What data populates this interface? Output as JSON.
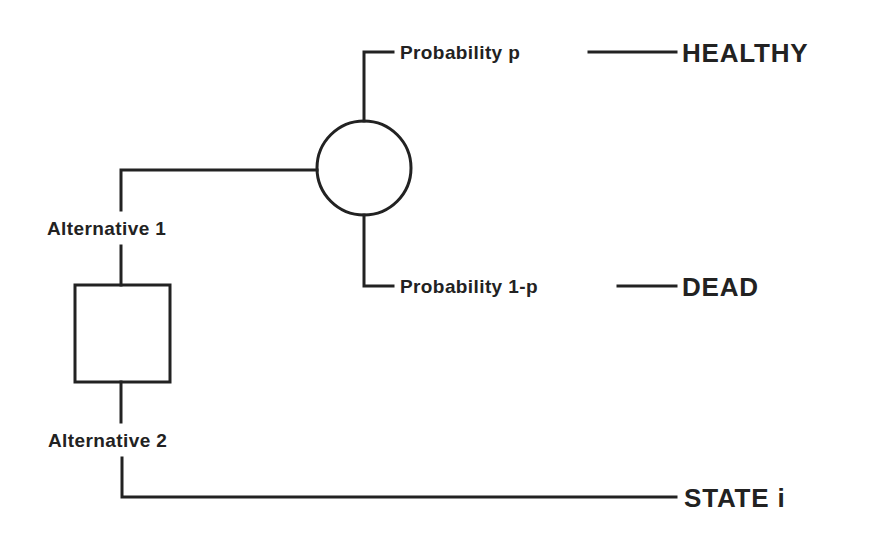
{
  "diagram": {
    "type": "decision-tree",
    "stroke_color": "#222222",
    "background": "#ffffff",
    "decision_node": {
      "shape": "square"
    },
    "chance_node": {
      "shape": "circle"
    },
    "alternatives": [
      {
        "label": "Alternative 1"
      },
      {
        "label": "Alternative 2"
      }
    ],
    "branches": [
      {
        "label": "Probability p",
        "outcome": "HEALTHY"
      },
      {
        "label": "Probability 1-p",
        "outcome": "DEAD"
      }
    ],
    "direct_outcome": "STATE i"
  }
}
